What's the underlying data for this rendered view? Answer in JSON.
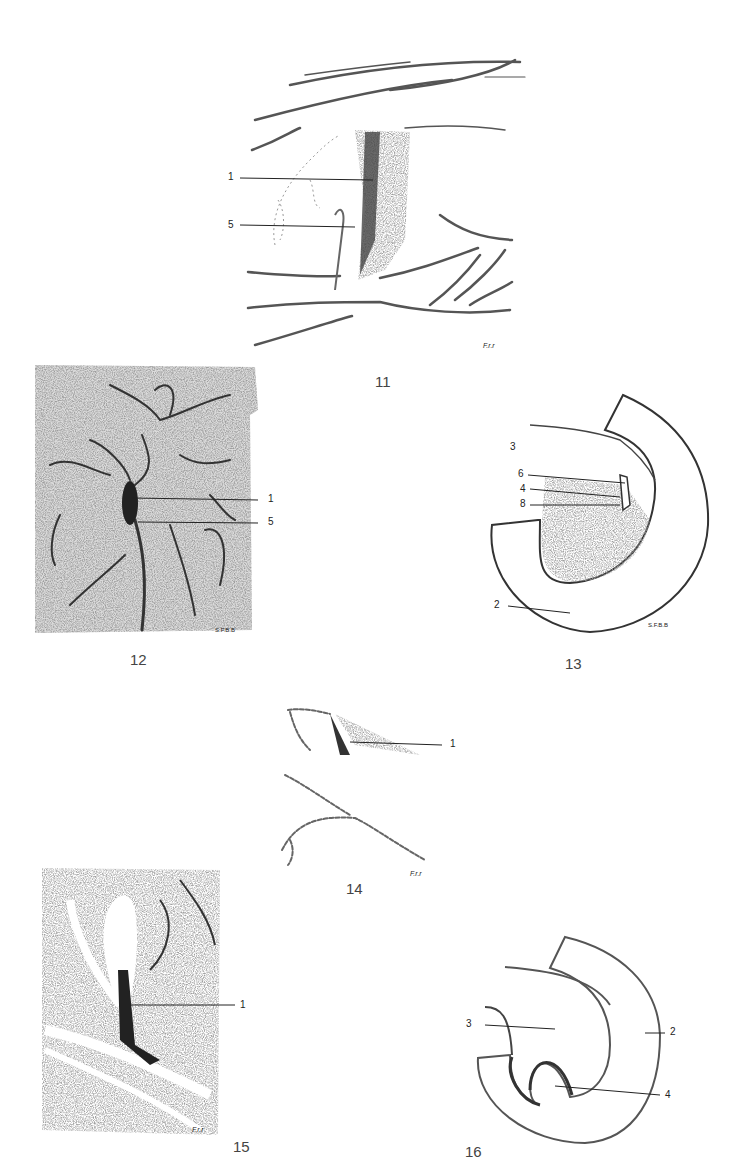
{
  "plate": {
    "figures": [
      {
        "number": "11",
        "labels": [
          "1",
          "5"
        ],
        "signature": "F.r.r"
      },
      {
        "number": "12",
        "labels": [
          "1",
          "5"
        ],
        "signature": "S.F.B.B"
      },
      {
        "number": "13",
        "labels": [
          "3",
          "6",
          "4",
          "8",
          "2"
        ],
        "signature": "S.F.B.B"
      },
      {
        "number": "14",
        "labels": [
          "1"
        ],
        "signature": "F.r.r"
      },
      {
        "number": "15",
        "labels": [
          "1"
        ],
        "signature": "F.r.r"
      },
      {
        "number": "16",
        "labels": [
          "3",
          "2",
          "4"
        ]
      }
    ]
  }
}
